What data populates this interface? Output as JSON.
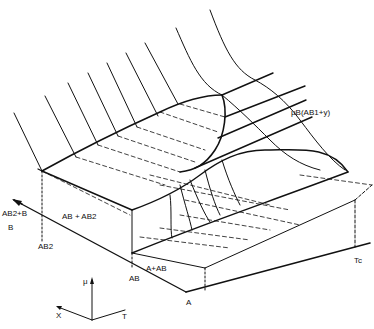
{
  "figure": {
    "labels": {
      "mu_b_curve": "μB(AB1+y)",
      "region_ab2_b": "AB2+B",
      "region_ab_ab2": "AB + AB2",
      "region_a_ab": "A+AB",
      "axis_b": "B",
      "point_ab2": "AB2",
      "point_ab": "AB",
      "point_a": "A",
      "point_tc": "Tc"
    },
    "axes": {
      "mu": "μ",
      "x": "X",
      "t": "T"
    }
  }
}
